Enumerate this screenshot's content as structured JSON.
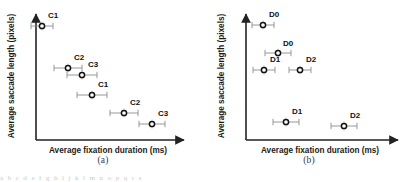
{
  "figure": {
    "bottom_partial_text": "a b c d  e f g   h i j k    l m n o     p q r s"
  },
  "panels": [
    {
      "id": "a",
      "caption": "(a)",
      "axes": {
        "xlabel": "Average fixation duration (ms)",
        "ylabel": "Average saccade length (pixels)",
        "x_origin": 36,
        "x_end": 186,
        "y_top": 12,
        "y_bottom": 140
      },
      "points": [
        {
          "label": "C1",
          "cx": 42,
          "cy": 26,
          "err": 11,
          "label_dx": 6,
          "label_dy": -8
        },
        {
          "label": "C2",
          "cx": 68,
          "cy": 68,
          "err": 14,
          "label_dx": 6,
          "label_dy": -8
        },
        {
          "label": "C3",
          "cx": 82,
          "cy": 75,
          "err": 15,
          "label_dx": 6,
          "label_dy": -8
        },
        {
          "label": "C1",
          "cx": 92,
          "cy": 95,
          "err": 15,
          "label_dx": 6,
          "label_dy": -8
        },
        {
          "label": "C2",
          "cx": 124,
          "cy": 113,
          "err": 14,
          "label_dx": 6,
          "label_dy": -8
        },
        {
          "label": "C3",
          "cx": 152,
          "cy": 124,
          "err": 13,
          "label_dx": 6,
          "label_dy": -8
        }
      ]
    },
    {
      "id": "b",
      "caption": "(b)",
      "axes": {
        "xlabel": "Average fixation duration (ms)",
        "ylabel": "Average saccade length (pixels)",
        "x_origin": 40,
        "x_end": 194,
        "y_top": 12,
        "y_bottom": 140
      },
      "points": [
        {
          "label": "D0",
          "cx": 57,
          "cy": 25,
          "err": 11,
          "label_dx": 6,
          "label_dy": -8
        },
        {
          "label": "D0",
          "cx": 72,
          "cy": 53,
          "err": 13,
          "label_dx": 5,
          "label_dy": -7
        },
        {
          "label": "D1",
          "cx": 58,
          "cy": 70,
          "err": 11,
          "label_dx": 6,
          "label_dy": -8
        },
        {
          "label": "D2",
          "cx": 94,
          "cy": 70,
          "err": 11,
          "label_dx": 6,
          "label_dy": -8
        },
        {
          "label": "D1",
          "cx": 80,
          "cy": 122,
          "err": 13,
          "label_dx": 6,
          "label_dy": -8
        },
        {
          "label": "D2",
          "cx": 138,
          "cy": 126,
          "err": 13,
          "label_dx": 6,
          "label_dy": -8
        }
      ]
    }
  ],
  "chart_data": {
    "type": "scatter",
    "title": "",
    "subtitle": "",
    "xlabel": "Average fixation duration (ms)",
    "ylabel": "Average saccade length (pixels)",
    "grid": false,
    "legend": "none",
    "axis_ticks": "none (qualitative axes, arrowheads at ends)",
    "note": "Two side-by-side scatter panels with horizontal error bars on each marker; markers are small open circles with a dark ring. Coordinates below are read in pixel space of the screenshot (y increases downward), since the axes carry no numeric tick labels.",
    "panels": [
      {
        "panel": "(a)",
        "series": [
          {
            "name": "Panel A points",
            "points": [
              {
                "label": "C1",
                "x_px": 42,
                "y_px": 26,
                "x_err_px": 11
              },
              {
                "label": "C2",
                "x_px": 68,
                "y_px": 68,
                "x_err_px": 14
              },
              {
                "label": "C3",
                "x_px": 82,
                "y_px": 75,
                "x_err_px": 15
              },
              {
                "label": "C1",
                "x_px": 92,
                "y_px": 95,
                "x_err_px": 15
              },
              {
                "label": "C2",
                "x_px": 124,
                "y_px": 113,
                "x_err_px": 14
              },
              {
                "label": "C3",
                "x_px": 152,
                "y_px": 124,
                "x_err_px": 13
              }
            ]
          }
        ],
        "trend": "monotonically decreasing: longer average fixation duration pairs with shorter average saccade length"
      },
      {
        "panel": "(b)",
        "series": [
          {
            "name": "Panel B points",
            "points": [
              {
                "label": "D0",
                "x_px": 57,
                "y_px": 25,
                "x_err_px": 11
              },
              {
                "label": "D0",
                "x_px": 72,
                "y_px": 53,
                "x_err_px": 13
              },
              {
                "label": "D1",
                "x_px": 58,
                "y_px": 70,
                "x_err_px": 11
              },
              {
                "label": "D2",
                "x_px": 94,
                "y_px": 70,
                "x_err_px": 11
              },
              {
                "label": "D1",
                "x_px": 80,
                "y_px": 122,
                "x_err_px": 13
              },
              {
                "label": "D2",
                "x_px": 138,
                "y_px": 126,
                "x_err_px": 13
              }
            ]
          }
        ],
        "trend": "upper cluster of D0/D1/D2 near the axis, two lower-right outliers labelled D1 and D2"
      }
    ]
  }
}
